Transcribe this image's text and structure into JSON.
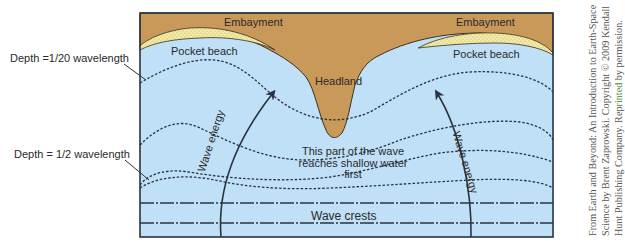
{
  "diagram": {
    "labels": {
      "embayment_left": "Embayment",
      "embayment_right": "Embayment",
      "pocket_beach_left": "Pocket beach",
      "pocket_beach_right": "Pocket beach",
      "headland": "Headland",
      "depth_20": "Depth =1/20 wavelength",
      "depth_2": "Depth = 1/2 wavelength",
      "wave_energy_left": "Wave energy",
      "wave_energy_right": "Wave energy",
      "shallow_note_line1": "This part of the wave",
      "shallow_note_line2": "reaches shallow water",
      "shallow_note_line3": "first",
      "wave_crests": "Wave crests"
    },
    "credit": {
      "line1": "From Earth and Beyond: An Introduction to Earth-Space",
      "line2": "Science by Brent Zaprowski. Copyright © 2009 Kendall",
      "line3_a": "Hunt Publishing Company. Rep",
      "line3_b": "rinted",
      "line3_c": " by permission."
    },
    "colors": {
      "land": "#c9995a",
      "water": "#bfe0f7",
      "sand": "#f3eaa6",
      "line": "#2b3340"
    }
  }
}
